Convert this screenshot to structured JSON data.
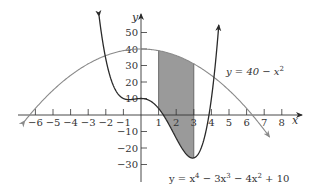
{
  "chart_data": {
    "type": "line",
    "title": "",
    "xlabel": "x",
    "ylabel": "y",
    "xlim": [
      -6.5,
      9
    ],
    "ylim": [
      -35,
      58
    ],
    "grid": false,
    "x_ticks": [
      -6,
      -5,
      -4,
      -3,
      -2,
      -1,
      1,
      2,
      3,
      4,
      5,
      6,
      7,
      8
    ],
    "x_tick_labels": [
      "−6",
      "−5",
      "−4",
      "−3",
      "−2",
      "−1",
      "1",
      "2",
      "3",
      "4",
      "5",
      "6",
      "7",
      "8"
    ],
    "y_ticks": [
      50,
      40,
      30,
      20,
      10,
      -10,
      -20,
      -30
    ],
    "y_tick_labels": [
      "50",
      "40",
      "30",
      "20",
      "10",
      "−10",
      "−20",
      "−30"
    ],
    "series": [
      {
        "name": "y = 40 − x²",
        "expression": "40 - x^2",
        "color": "#8a8a8a",
        "x": [
          -6,
          -5,
          -4,
          -3,
          -2,
          -1,
          0,
          1,
          2,
          3,
          4,
          5,
          6,
          7
        ],
        "values": [
          4,
          15,
          24,
          31,
          36,
          39,
          40,
          39,
          36,
          31,
          24,
          15,
          4,
          -9
        ]
      },
      {
        "name": "y = x⁴ − 3x³ − 4x² + 10",
        "expression": "x^4 - 3x^3 - 4x^2 + 10",
        "color": "#2a2a2a",
        "x": [
          -2,
          -1.5,
          -1,
          -0.5,
          0,
          0.5,
          1,
          1.5,
          2,
          2.5,
          3,
          3.5,
          4
        ],
        "values": [
          34,
          10.19,
          8,
          9.44,
          10,
          8.69,
          4,
          -3.06,
          -10,
          -15.8,
          -26,
          -15.8,
          10
        ]
      }
    ],
    "shaded_region": {
      "x_from": 1,
      "x_to": 3,
      "between": [
        "y = 40 − x²",
        "y = x⁴ − 3x³ − 4x² + 10"
      ],
      "color": "#9a9a9a"
    },
    "annotations": [
      {
        "text": "y = 40 − x²",
        "near": [
          4.5,
          28
        ]
      },
      {
        "text": "y = x⁴ − 3x³ − 4x² + 10",
        "near": [
          1.5,
          -35
        ]
      }
    ]
  },
  "labels": {
    "x_axis": "x",
    "y_axis": "y",
    "parabola_eq": "y = 40 − x",
    "parabola_exp": "2",
    "quartic_eq_parts": [
      "y = x",
      "4",
      " − 3x",
      "3",
      " − 4x",
      "2",
      " + 10"
    ]
  }
}
